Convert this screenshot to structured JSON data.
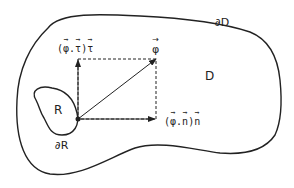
{
  "diagram": {
    "regions": {
      "outer": {
        "label": "D",
        "boundary_label": "∂D"
      },
      "inner": {
        "label": "R",
        "boundary_label": "∂R"
      }
    },
    "vectors": {
      "phi": {
        "symbol": "φ"
      },
      "tangential": {
        "open": "(",
        "phi": "φ",
        "dot": ".",
        "tau": "τ",
        "close": ")",
        "unit": "τ"
      },
      "normal": {
        "open": "(",
        "phi": "φ",
        "dot": ".",
        "n": "n",
        "close": ")",
        "unit": "n"
      }
    },
    "colors": {
      "stroke": "#222222",
      "background": "#ffffff"
    }
  }
}
